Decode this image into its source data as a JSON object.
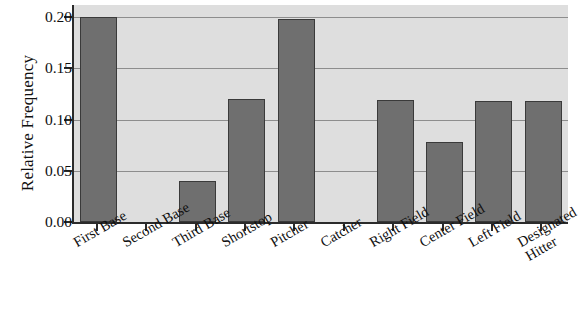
{
  "chart_data": {
    "type": "bar",
    "title": "",
    "xlabel": "",
    "ylabel": "Relative Frequency",
    "categories": [
      "First Base",
      "Second Base",
      "Third Base",
      "Shortstop",
      "Pitcher",
      "Catcher",
      "Right Field",
      "Center Field",
      "Left Field",
      "Designated Hitter"
    ],
    "values": [
      0.2,
      0.0,
      0.04,
      0.12,
      0.198,
      0.0,
      0.119,
      0.078,
      0.118,
      0.118
    ],
    "ylim": [
      0.0,
      0.2
    ],
    "ytick_labels": [
      "0.00",
      "0.05",
      "0.10",
      "0.15",
      "0.20"
    ],
    "ytick_values": [
      0.0,
      0.05,
      0.1,
      0.15,
      0.2
    ],
    "grid": true,
    "legend": "none",
    "bar_color": "#6f6f6f",
    "bar_edge_color": "#3a3a3a",
    "plot_background": "#dedede",
    "axis_color": "#2b2b2b",
    "gridline_color": "#8d8d8d"
  }
}
